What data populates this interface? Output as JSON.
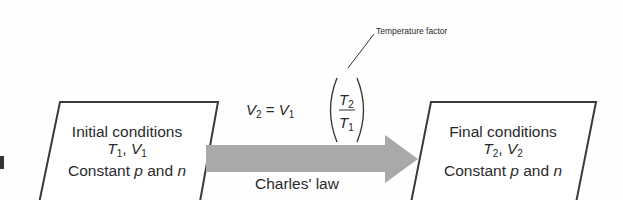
{
  "diagram": {
    "initial_box": {
      "title": "Initial conditions",
      "vars": {
        "a": "T",
        "a_sub": "1",
        "sep": ", ",
        "b": "V",
        "b_sub": "1"
      },
      "constant_prefix": "Constant ",
      "p": "p",
      "and": " and ",
      "n": "n"
    },
    "final_box": {
      "title": "Final conditions",
      "vars": {
        "a": "T",
        "a_sub": "2",
        "sep": ", ",
        "b": "V",
        "b_sub": "2"
      },
      "constant_prefix": "Constant ",
      "p": "p",
      "and": " and ",
      "n": "n"
    },
    "arrow_label": "Charles' law",
    "equation": {
      "lhs": "V",
      "lhs_sub": "2",
      "equals": " = ",
      "rhs": "V",
      "rhs_sub": "1",
      "num": "T",
      "num_sub": "2",
      "den": "T",
      "den_sub": "1"
    },
    "annotation": "Temperature factor",
    "colors": {
      "arrow": "#a9a9a9",
      "border": "#3a3a3a"
    }
  }
}
